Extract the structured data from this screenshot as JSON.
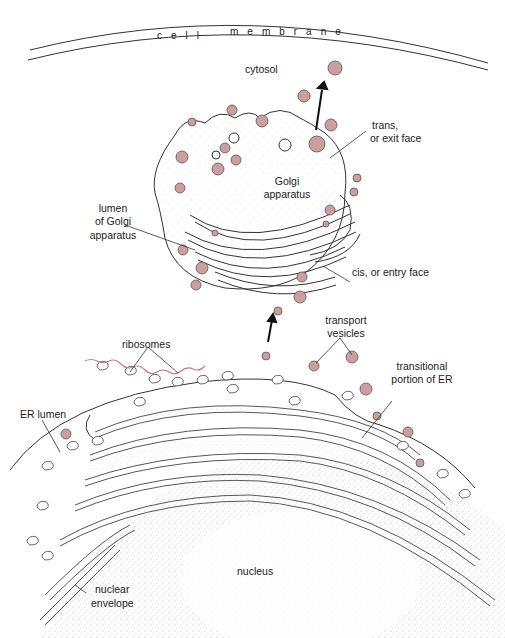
{
  "diagram": {
    "colors": {
      "vesicle_fill": "#c9a0a0",
      "vesicle_stroke": "#6e4a4a",
      "line": "#333333",
      "mrna": "#c77b7b",
      "stipple": "#9a9a9a"
    },
    "labels": {
      "cell_membrane_1": "cell",
      "cell_membrane_2": "membrane",
      "cytosol": "cytosol",
      "trans_face_1": "trans,",
      "trans_face_2": "or exit face",
      "golgi_1": "Golgi",
      "golgi_2": "apparatus",
      "lumen_golgi_1": "lumen",
      "lumen_golgi_2": "of Golgi",
      "lumen_golgi_3": "apparatus",
      "cis_face": "cis, or entry face",
      "transport_vesicles_1": "transport",
      "transport_vesicles_2": "vesicles",
      "ribosomes": "ribosomes",
      "transitional_er_1": "transitional",
      "transitional_er_2": "portion of ER",
      "er_lumen": "ER lumen",
      "nucleus": "nucleus",
      "nuclear_envelope_1": "nuclear",
      "nuclear_envelope_2": "envelope"
    }
  }
}
